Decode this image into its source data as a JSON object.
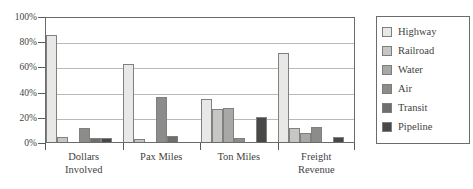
{
  "chart_data": {
    "type": "bar",
    "title": "",
    "subtitle": "",
    "xlabel": "",
    "ylabel": "",
    "ylim": [
      0,
      100
    ],
    "y_ticks": [
      0,
      20,
      40,
      60,
      80,
      100
    ],
    "y_tick_labels": [
      "0%",
      "20%",
      "40%",
      "60%",
      "80%",
      "100%"
    ],
    "grid": true,
    "legend_position": "right",
    "categories": [
      "Dollars Involved",
      "Pax Miles",
      "Ton Miles",
      "Freight Revenue"
    ],
    "category_lines": [
      [
        "Dollars",
        "Involved"
      ],
      [
        "Pax Miles"
      ],
      [
        "Ton Miles"
      ],
      [
        "Freight",
        "Revenue"
      ]
    ],
    "series": [
      {
        "name": "Highway",
        "color": "#e8e8e6",
        "values": [
          85,
          62,
          34,
          71
        ]
      },
      {
        "name": "Railroad",
        "color": "#c6c6c4",
        "values": [
          4,
          2,
          26,
          11
        ]
      },
      {
        "name": "Water",
        "color": "#a8a8a6",
        "values": [
          0,
          0,
          27,
          7
        ]
      },
      {
        "name": "Air",
        "color": "#8c8c8a",
        "values": [
          11,
          36,
          3,
          12
        ]
      },
      {
        "name": "Transit",
        "color": "#6e6e6c",
        "values": [
          3,
          5,
          0,
          0
        ]
      },
      {
        "name": "Pipeline",
        "color": "#484846",
        "values": [
          3,
          0,
          20,
          4
        ]
      }
    ]
  },
  "legend": {
    "items": [
      {
        "label": "Highway"
      },
      {
        "label": "Railroad"
      },
      {
        "label": "Water"
      },
      {
        "label": "Air"
      },
      {
        "label": "Transit"
      },
      {
        "label": "Pipeline"
      }
    ]
  }
}
